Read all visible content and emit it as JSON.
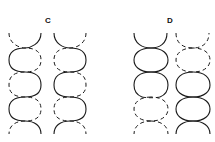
{
  "figure": {
    "panels": [
      {
        "label": "C",
        "description": "Two helical strand pairs drawn as interlocking S-curves; one strand solid, the partner strand dashed, crossing over each other",
        "columns": [
          {
            "strand_a": "solid S-curve",
            "strand_b": "dashed S-curve"
          },
          {
            "strand_a": "solid S-curve",
            "strand_b": "dashed S-curve"
          }
        ]
      },
      {
        "label": "D",
        "description": "Two columns of stacked ovals; left column solid at top and dashed at bottom, right column dashed at top and solid at bottom",
        "columns": [
          {
            "top": "solid",
            "bottom": "dashed"
          },
          {
            "top": "dashed",
            "bottom": "solid"
          }
        ]
      }
    ]
  }
}
